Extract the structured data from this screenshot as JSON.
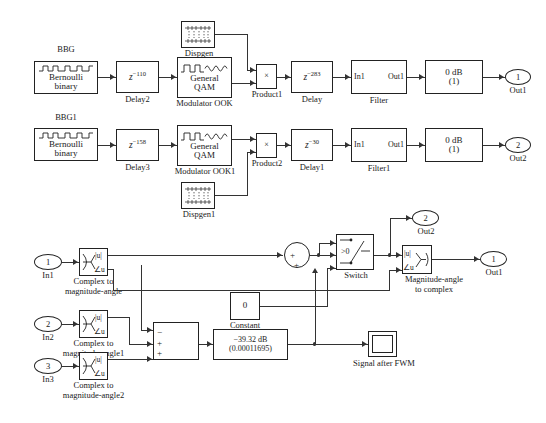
{
  "diagram": {
    "upper": {
      "bbg_label": "BBG",
      "bbg1_label": "BBG1",
      "bernoulli_line1": "Bernoulli",
      "bernoulli_line2": "binary",
      "delay2_value": "z",
      "delay2_exp": "−110",
      "delay2_label": "Delay2",
      "delay3_value": "z",
      "delay3_exp": "−158",
      "delay3_label": "Delay3",
      "qam_line1": "General",
      "qam_line2": "QAM",
      "mod_ook_label": "Modulator OOK",
      "mod_ook1_label": "Modulator OOK1",
      "dispgen_label": "Dispgen",
      "dispgen1_label": "Dispgen1",
      "product1_symbol": "×",
      "product1_label": "Product1",
      "product2_symbol": "×",
      "product2_label": "Product2",
      "delay_value": "z",
      "delay_exp": "−283",
      "delay_label": "Delay",
      "delay1_value": "z",
      "delay1_exp": "−30",
      "delay1_label": "Delay1",
      "filter_in": "In1",
      "filter_out": "Out1",
      "filter_label": "Filter",
      "filter1_label": "Filter1",
      "gain_line1": "0 dB",
      "gain_line2": "(1)",
      "out1_num": "1",
      "out1_label": "Out1",
      "out2_num": "2",
      "out2_label": "Out2"
    },
    "lower": {
      "in1_num": "1",
      "in1_label": "In1",
      "in2_num": "2",
      "in2_label": "In2",
      "in3_num": "3",
      "in3_label": "In3",
      "c2ma_line1": "Complex to",
      "c2ma_line2": "magnitude-angle",
      "c2ma1_line2": "magnitude-angle1",
      "c2ma2_line2": "magnitude-angle2",
      "mag_abs": "|u|",
      "mag_ang": "∠u",
      "constant_value": "0",
      "constant_label": "Constant",
      "gain_line1": "−39.32 dB",
      "gain_line2": "(0.00011695)",
      "switch_cond": ">0",
      "switch_label": "Switch",
      "scope_label": "Signal after FWM",
      "m2c_line1": "Magnitude-angle",
      "m2c_line2": "to complex",
      "out1_num": "1",
      "out1_label": "Out1",
      "out2_num": "2",
      "out2_label": "Out2",
      "sum_plus": "+",
      "sum_minus": "−"
    },
    "colors": {
      "line": "#333333",
      "block_border": "#222222",
      "background": "#ffffff",
      "text": "#1a1a1a"
    }
  }
}
